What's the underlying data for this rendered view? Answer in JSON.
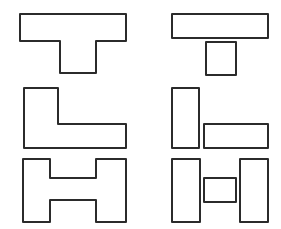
{
  "page": {
    "background_color": "#ffffff",
    "width": 281,
    "height": 229
  },
  "style": {
    "stroke_color": "#2b2b2b",
    "fill_color": "#ffffff",
    "stroke_width": 2,
    "rendering": "hand-drawn"
  },
  "columns": [
    {
      "id": "left-column",
      "label": "Compound outlines",
      "description": "Each letter shape drawn as one continuous merged outline."
    },
    {
      "id": "right-column",
      "label": "Decomposed rectangles",
      "description": "The same letter shapes split into their constituent separate rectangles."
    }
  ],
  "rows": [
    {
      "id": "row-t",
      "label": "T shape",
      "part_count": 2
    },
    {
      "id": "row-l",
      "label": "L shape",
      "part_count": 2
    },
    {
      "id": "row-h",
      "label": "H shape",
      "part_count": 3
    }
  ],
  "figures": [
    {
      "id": "t-compound",
      "name": "t-shape-compound",
      "row": "row-t",
      "column": "left-column",
      "kind": "polygon",
      "points": "20,14 126,14 126,41 96,41 96,73 60,73 60,41 20,41"
    },
    {
      "id": "t-decomposed",
      "name": "t-shape-decomposed",
      "row": "row-t",
      "column": "right-column",
      "kind": "rect-group",
      "parts": [
        {
          "name": "t-top-bar-rect",
          "x": 172,
          "y": 14,
          "w": 96,
          "h": 24
        },
        {
          "name": "t-stem-rect",
          "x": 206,
          "y": 42,
          "w": 30,
          "h": 33
        }
      ]
    },
    {
      "id": "l-compound",
      "name": "l-shape-compound",
      "row": "row-l",
      "column": "left-column",
      "kind": "polygon",
      "points": "24,88 58,88 58,124 126,124 126,148 24,148"
    },
    {
      "id": "l-decomposed",
      "name": "l-shape-decomposed",
      "row": "row-l",
      "column": "right-column",
      "kind": "rect-group",
      "parts": [
        {
          "name": "l-vertical-rect",
          "x": 172,
          "y": 88,
          "w": 27,
          "h": 60
        },
        {
          "name": "l-horizontal-rect",
          "x": 204,
          "y": 124,
          "w": 64,
          "h": 24
        }
      ]
    },
    {
      "id": "h-compound",
      "name": "h-shape-compound",
      "row": "row-h",
      "column": "left-column",
      "kind": "polygon",
      "points": "23,159 50,159 50,178 96,178 96,159 126,159 126,222 96,222 96,200 50,200 50,222 23,222"
    },
    {
      "id": "h-decomposed",
      "name": "h-shape-decomposed",
      "row": "row-h",
      "column": "right-column",
      "kind": "rect-group",
      "parts": [
        {
          "name": "h-left-leg-rect",
          "x": 172,
          "y": 159,
          "w": 28,
          "h": 63
        },
        {
          "name": "h-crossbar-rect",
          "x": 204,
          "y": 178,
          "w": 32,
          "h": 24
        },
        {
          "name": "h-right-leg-rect",
          "x": 240,
          "y": 159,
          "w": 28,
          "h": 63
        }
      ]
    }
  ]
}
